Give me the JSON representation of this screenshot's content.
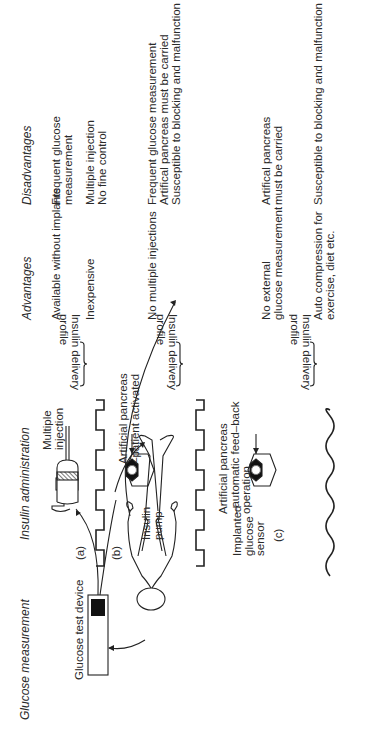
{
  "headers": {
    "glucose_measurement": "Glucose measurement",
    "insulin_administration": "Insulin administration",
    "advantages": "Advantages",
    "disadvantages": "Disadvantages"
  },
  "labels": {
    "glucose_test_device": "Glucose test device",
    "implanted_sensor": [
      "Implanted",
      "glucose",
      "sensor"
    ],
    "path_a": "(a)",
    "path_b": "(b)",
    "path_c": "(c)",
    "multiple_injection": [
      "Multiple",
      "injection"
    ],
    "insulin_pump": [
      "Insulin",
      "pump"
    ],
    "ap_patient": [
      "Artificial pancreas",
      "–patient activated"
    ],
    "ap_feedback": [
      "Artificial pancreas",
      "–automatic feed–back",
      "operation"
    ],
    "delivery_profile": [
      "Insulin delivery",
      "profile"
    ]
  },
  "rows": [
    {
      "method": "Multiple injection",
      "advantages": [
        "Available without implants",
        "",
        "Inexpensive"
      ],
      "disadvantages": [
        "Frequent glucose",
        "measurement",
        "",
        "Multiple injection",
        "No fine control"
      ]
    },
    {
      "method": "Artificial pancreas – patient activated",
      "advantages": [
        "No multiple injections"
      ],
      "disadvantages": [
        "Frequent glucose measurement",
        "Artifical pancreas must be carried",
        "Susceptible to blocking  and malfunction"
      ]
    },
    {
      "method": "Artificial pancreas – automatic feed-back operation",
      "advantages": [
        "No external",
        "glucose measurement",
        "",
        "Auto compression for",
        "exercise, diet etc."
      ],
      "disadvantages": [
        "Artifical pancreas",
        "must be carried",
        "",
        "",
        "Susceptible to blocking and malfunction"
      ]
    }
  ]
}
